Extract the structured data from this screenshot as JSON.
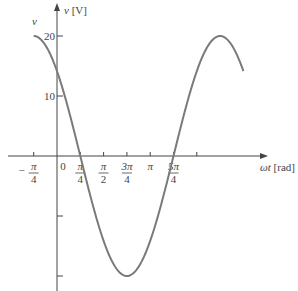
{
  "chart_data": {
    "type": "line",
    "title": "",
    "xlabel": "ωt [rad]",
    "ylabel": "v [V]",
    "curve_label": "v",
    "function": "v = 20 cos(ωt + π/4)",
    "xlim": [
      -0.7854,
      6.2832
    ],
    "ylim": [
      -20,
      20
    ],
    "x_ticks": [
      {
        "value": -0.7854,
        "num": "π",
        "den": "4",
        "sign": "−"
      },
      {
        "value": 0,
        "label": "0"
      },
      {
        "value": 0.7854,
        "num": "π",
        "den": "4"
      },
      {
        "value": 1.5708,
        "num": "π",
        "den": "2"
      },
      {
        "value": 2.3562,
        "num": "3π",
        "den": "4"
      },
      {
        "value": 3.1416,
        "label": "π"
      },
      {
        "value": 3.927,
        "num": "5π",
        "den": "4"
      },
      {
        "value": 4.7124,
        "label": ""
      }
    ],
    "y_ticks": [
      {
        "value": 20,
        "label": "20"
      },
      {
        "value": 10,
        "label": "10"
      },
      {
        "value": -10,
        "label": ""
      },
      {
        "value": -20,
        "label": ""
      }
    ],
    "series": [
      {
        "name": "v",
        "x": [
          -0.7854,
          0,
          0.7854,
          1.5708,
          2.3562,
          3.1416,
          3.927,
          4.7124,
          5.4978,
          6.2832
        ],
        "values": [
          20,
          14.14,
          0,
          -14.14,
          -20,
          -14.14,
          0,
          14.14,
          20,
          14.14
        ]
      }
    ],
    "grid": false,
    "legend": "none",
    "colors": {
      "curve": "#7a7a7a",
      "axis": "#444444"
    }
  }
}
